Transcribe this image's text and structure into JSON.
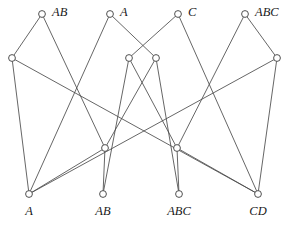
{
  "figure": {
    "kind": "undirected-graph-drawing",
    "width": 288,
    "height": 225,
    "background_color": "#ffffff",
    "edge_color": "#4a4a4a",
    "node_fill_color": "#ffffff",
    "node_stroke_color": "#3d3d3d",
    "label_color": "#1a1a1a",
    "node_radius": 3.4
  },
  "nodes": [
    {
      "id": "t1",
      "x": 42,
      "y": 14,
      "label": "AB",
      "label_x": 52,
      "label_y": 13,
      "label_position": "right"
    },
    {
      "id": "t2",
      "x": 110,
      "y": 14,
      "label": "A",
      "label_x": 120,
      "label_y": 13,
      "label_position": "right"
    },
    {
      "id": "t3",
      "x": 178,
      "y": 14,
      "label": "C",
      "label_x": 188,
      "label_y": 13,
      "label_position": "right"
    },
    {
      "id": "t4",
      "x": 245,
      "y": 14,
      "label": "ABC",
      "label_x": 255,
      "label_y": 13,
      "label_position": "right"
    },
    {
      "id": "m1",
      "x": 12,
      "y": 58,
      "label": "",
      "label_x": 0,
      "label_y": 0,
      "label_position": "none"
    },
    {
      "id": "m2",
      "x": 129,
      "y": 58,
      "label": "",
      "label_x": 0,
      "label_y": 0,
      "label_position": "none"
    },
    {
      "id": "m3",
      "x": 156,
      "y": 58,
      "label": "",
      "label_x": 0,
      "label_y": 0,
      "label_position": "none"
    },
    {
      "id": "m4",
      "x": 277,
      "y": 58,
      "label": "",
      "label_x": 0,
      "label_y": 0,
      "label_position": "none"
    },
    {
      "id": "l1",
      "x": 105,
      "y": 148,
      "label": "",
      "label_x": 0,
      "label_y": 0,
      "label_position": "none"
    },
    {
      "id": "l2",
      "x": 177,
      "y": 148,
      "label": "",
      "label_x": 0,
      "label_y": 0,
      "label_position": "none"
    },
    {
      "id": "b1",
      "x": 29,
      "y": 194,
      "label": "A",
      "label_x": 29,
      "label_y": 212,
      "label_position": "below"
    },
    {
      "id": "b2",
      "x": 103,
      "y": 194,
      "label": "AB",
      "label_x": 103,
      "label_y": 212,
      "label_position": "below"
    },
    {
      "id": "b3",
      "x": 179,
      "y": 194,
      "label": "ABC",
      "label_x": 179,
      "label_y": 212,
      "label_position": "below"
    },
    {
      "id": "b4",
      "x": 258,
      "y": 194,
      "label": "CD",
      "label_x": 258,
      "label_y": 212,
      "label_position": "below"
    }
  ],
  "edges": [
    {
      "from": "t1",
      "to": "m1"
    },
    {
      "from": "t1",
      "to": "l1"
    },
    {
      "from": "t2",
      "to": "b1"
    },
    {
      "from": "t2",
      "to": "m3"
    },
    {
      "from": "t3",
      "to": "m2"
    },
    {
      "from": "t3",
      "to": "b4"
    },
    {
      "from": "t4",
      "to": "m4"
    },
    {
      "from": "t4",
      "to": "l2"
    },
    {
      "from": "m1",
      "to": "b1"
    },
    {
      "from": "m1",
      "to": "b4"
    },
    {
      "from": "m2",
      "to": "b2"
    },
    {
      "from": "m2",
      "to": "l2"
    },
    {
      "from": "m3",
      "to": "l1"
    },
    {
      "from": "m3",
      "to": "b3"
    },
    {
      "from": "m4",
      "to": "b1"
    },
    {
      "from": "m4",
      "to": "b4"
    },
    {
      "from": "l1",
      "to": "b1"
    },
    {
      "from": "l1",
      "to": "b2"
    },
    {
      "from": "l2",
      "to": "b3"
    },
    {
      "from": "l2",
      "to": "b4"
    }
  ]
}
